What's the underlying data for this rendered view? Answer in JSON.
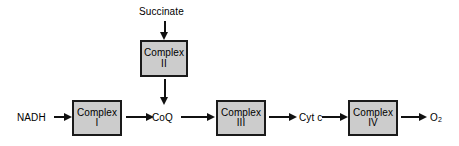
{
  "diagram": {
    "background_color": "#ffffff",
    "box_fill_color": "#cccccc",
    "box_border_color": "#1a1a1a",
    "arrow_color": "#111111",
    "text_color": "#000000"
  },
  "nodes": {
    "complex_i": {
      "line1": "Complex",
      "line2": "I"
    },
    "complex_ii": {
      "line1": "Complex",
      "line2": "II"
    },
    "complex_iii": {
      "line1": "Complex",
      "line2": "III"
    },
    "complex_iv": {
      "line1": "Complex",
      "line2": "IV"
    }
  },
  "labels": {
    "succinate": "Succinate",
    "nadh": "NADH",
    "coq": "CoQ",
    "cyt_c": "Cyt c",
    "oxygen": "O",
    "oxygen_subscript": "2"
  },
  "flow": {
    "steps": [
      "NADH",
      "Complex I",
      "CoQ",
      "Complex III",
      "Cyt c",
      "Complex IV",
      "O2"
    ],
    "branch": [
      "Succinate",
      "Complex II",
      "CoQ"
    ]
  }
}
